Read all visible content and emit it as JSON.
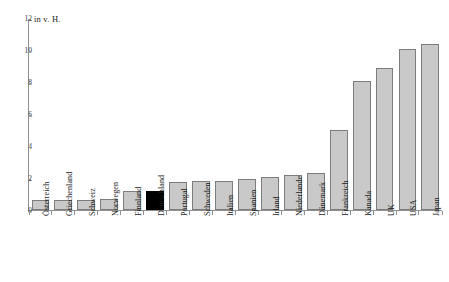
{
  "chart_data": {
    "type": "bar",
    "title": "",
    "subtitle": "",
    "unit_caption": "in v. H.",
    "xlabel": "",
    "ylabel": "",
    "ylim": [
      0,
      12
    ],
    "yticks": [
      0,
      2,
      4,
      6,
      8,
      10,
      12
    ],
    "grid": false,
    "legend": null,
    "highlight_category": "Deutschland",
    "colors": {
      "bar_fill": "#c9c9c9",
      "bar_border": "#7d7d7d",
      "highlight_fill": "#000000",
      "axis": "#909090",
      "text": "#1a1a1a",
      "background": "#ffffff"
    },
    "categories": [
      "Österreich",
      "Griechenland",
      "Schweiz",
      "Norwegen",
      "Finnland",
      "Deutschland",
      "Portugal",
      "Schweden",
      "Italien",
      "Spanien",
      "Irland",
      "Niederlande",
      "Dänemark",
      "Frankreich",
      "Kanada",
      "UK",
      "USA",
      "Japan"
    ],
    "values": [
      0.6,
      0.6,
      0.65,
      0.7,
      1.2,
      1.2,
      1.75,
      1.8,
      1.85,
      1.95,
      2.05,
      2.2,
      2.3,
      5.0,
      8.1,
      8.9,
      10.1,
      10.4
    ]
  }
}
